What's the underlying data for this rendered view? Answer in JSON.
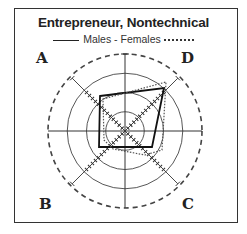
{
  "chart_data": {
    "type": "radar",
    "title": "Entrepreneur, Nontechnical",
    "legend": [
      {
        "name": "Males",
        "style": "solid"
      },
      {
        "name": "Females",
        "style": "dotted"
      }
    ],
    "legend_text": "Males - Females",
    "quadrants": [
      "A",
      "D",
      "C",
      "B"
    ],
    "axes": {
      "center": [
        125,
        131
      ],
      "max_radius_px": 77,
      "rings_fraction": [
        0.25,
        0.5,
        0.75,
        1.0
      ],
      "outer_ring_style": "dashed"
    },
    "series": [
      {
        "name": "Males",
        "style": "solid",
        "values": {
          "A": 0.56,
          "D": 0.75,
          "C": 0.41,
          "B": 0.4
        },
        "points": [
          [
            100,
            96
          ],
          [
            164,
            88
          ],
          [
            152,
            147
          ],
          [
            99,
            147
          ]
        ]
      },
      {
        "name": "Females",
        "style": "dotted",
        "values": {
          "A": 0.5,
          "D": 0.83,
          "C": 0.54,
          "B": 0.29
        },
        "points": [
          [
            103,
            99
          ],
          [
            166,
            82
          ],
          [
            162,
            150
          ],
          [
            145,
            155
          ],
          [
            113,
            149
          ],
          [
            104,
            140
          ]
        ]
      }
    ]
  },
  "labels": {
    "title": "Entrepreneur, Nontechnical",
    "legend_males": "Males - Females",
    "quad_a": "A",
    "quad_b": "B",
    "quad_c": "C",
    "quad_d": "D"
  }
}
